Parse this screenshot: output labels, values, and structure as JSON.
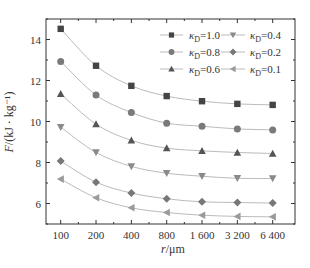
{
  "chart_data": {
    "type": "line",
    "title": "",
    "xlabel": "r/μm",
    "ylabel": "F/(kJ · kg⁻¹)",
    "x_scale": "log2",
    "x": [
      100,
      200,
      400,
      800,
      1600,
      3200,
      6400
    ],
    "x_tick_labels": [
      "100",
      "200",
      "400",
      "800",
      "1 600",
      "3 200",
      "6 400"
    ],
    "y_ticks": [
      6,
      8,
      10,
      12,
      14
    ],
    "y_tick_labels": [
      "6",
      "8",
      "10",
      "12",
      "14"
    ],
    "xlim": [
      70,
      8400
    ],
    "ylim": [
      5,
      15
    ],
    "grid": false,
    "legend_position": "upper right, 2 columns",
    "series": [
      {
        "name": "κD=1.0",
        "label_main": "κ",
        "label_sub": "D",
        "label_value": "=1.0",
        "marker": "square",
        "color": "#444444",
        "values": [
          14.52,
          12.72,
          11.74,
          11.24,
          10.99,
          10.86,
          10.81
        ]
      },
      {
        "name": "κD=0.8",
        "label_main": "κ",
        "label_sub": "D",
        "label_value": "=0.8",
        "marker": "circle",
        "color": "#7a7a7a",
        "values": [
          12.93,
          11.29,
          10.44,
          9.92,
          9.77,
          9.64,
          9.59
        ]
      },
      {
        "name": "κD=0.6",
        "label_main": "κ",
        "label_sub": "D",
        "label_value": "=0.6",
        "marker": "triangle-up",
        "color": "#555555",
        "values": [
          11.35,
          9.87,
          9.08,
          8.7,
          8.57,
          8.49,
          8.44
        ]
      },
      {
        "name": "κD=0.4",
        "label_main": "κ",
        "label_sub": "D",
        "label_value": "=0.4",
        "marker": "triangle-down",
        "color": "#8a8a8a",
        "values": [
          9.72,
          8.49,
          7.81,
          7.48,
          7.33,
          7.23,
          7.22
        ]
      },
      {
        "name": "κD=0.2",
        "label_main": "κ",
        "label_sub": "D",
        "label_value": "=0.2",
        "marker": "diamond",
        "color": "#777777",
        "values": [
          8.07,
          7.04,
          6.51,
          6.23,
          6.08,
          6.05,
          6.02
        ]
      },
      {
        "name": "κD=0.1",
        "label_main": "κ",
        "label_sub": "D",
        "label_value": "=0.1",
        "marker": "triangle-left",
        "color": "#9a9a9a",
        "values": [
          7.19,
          6.28,
          5.79,
          5.56,
          5.43,
          5.37,
          5.35
        ]
      }
    ],
    "line_color": "#bbbbbb",
    "axis_color": "#333333"
  }
}
